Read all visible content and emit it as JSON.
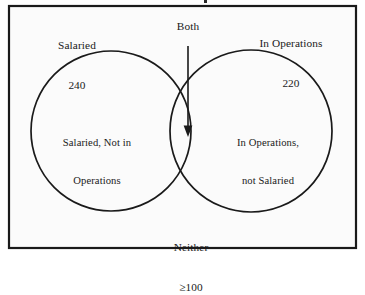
{
  "diagram": {
    "type": "venn-two-set",
    "frame": {
      "border_color": "#1a1a1a",
      "background_color": "#fbfbfb"
    },
    "stroke_color": "#1a1a1a",
    "sets": {
      "left": {
        "name": "Salaried",
        "count": "240",
        "region_line1": "Salaried, Not in",
        "region_line2": "Operations"
      },
      "right": {
        "name": "In Operations",
        "count": "220",
        "region_line1": "In Operations,",
        "region_line2": "not Salaried"
      }
    },
    "intersection": {
      "label": "Both",
      "pointer": "down-arrow"
    },
    "outside": {
      "label": "Neither",
      "count": "≥100"
    }
  }
}
